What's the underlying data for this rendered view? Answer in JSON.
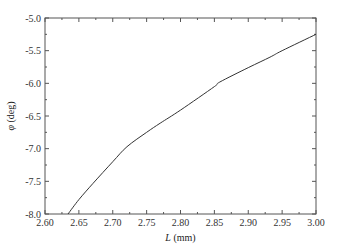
{
  "chart_data": {
    "type": "line",
    "title": "",
    "xlabel_var": "L",
    "xlabel_unit": " (mm)",
    "ylabel_var": "φ",
    "ylabel_unit": " (deg)",
    "xlim": [
      2.6,
      3.0
    ],
    "ylim": [
      -8.0,
      -5.0
    ],
    "xticks": [
      "2.60",
      "2.65",
      "2.70",
      "2.75",
      "2.80",
      "2.85",
      "2.90",
      "2.95",
      "3.00"
    ],
    "yticks": [
      "-5.0",
      "-5.5",
      "-6.0",
      "-6.5",
      "-7.0",
      "-7.5",
      "-8.0"
    ],
    "grid": false,
    "legend": null,
    "series": [
      {
        "name": "φ vs L",
        "color": "#333333",
        "x": [
          2.634,
          2.65,
          2.671,
          2.7,
          2.721,
          2.75,
          2.77,
          2.8,
          2.85,
          2.858,
          2.9,
          2.932,
          2.95,
          3.0
        ],
        "y": [
          -8.0,
          -7.78,
          -7.53,
          -7.2,
          -6.97,
          -6.75,
          -6.61,
          -6.41,
          -6.05,
          -5.98,
          -5.76,
          -5.6,
          -5.5,
          -5.25
        ]
      }
    ]
  }
}
